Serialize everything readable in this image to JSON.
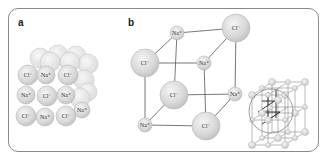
{
  "figure": {
    "panels": [
      {
        "label": "a",
        "description": "close-packed NaCl sphere model"
      },
      {
        "label": "b",
        "description": "NaCl unit cell ball-and-stick with lattice inset"
      }
    ]
  },
  "panel_a": {
    "label": "a",
    "front_ions": [
      {
        "text": "Cl⁻",
        "x": 28,
        "y": 75,
        "r": 10
      },
      {
        "text": "Na⁺",
        "x": 46,
        "y": 75,
        "r": 9
      },
      {
        "text": "Cl⁻",
        "x": 68,
        "y": 75,
        "r": 10
      },
      {
        "text": "Na⁺",
        "x": 26,
        "y": 95,
        "r": 9
      },
      {
        "text": "Cl⁻",
        "x": 47,
        "y": 96,
        "r": 10
      },
      {
        "text": "Na⁺",
        "x": 66,
        "y": 95,
        "r": 9
      },
      {
        "text": "Cl⁻",
        "x": 26,
        "y": 116,
        "r": 10
      },
      {
        "text": "Na⁺",
        "x": 45,
        "y": 117,
        "r": 9
      },
      {
        "text": "Cl⁻",
        "x": 66,
        "y": 116,
        "r": 10
      },
      {
        "text": "Na⁺",
        "x": 82,
        "y": 110,
        "r": 8
      }
    ]
  },
  "panel_b": {
    "label": "b",
    "ions": [
      {
        "id": "btl",
        "text": "Na⁺",
        "x": 177,
        "y": 33,
        "r": 7
      },
      {
        "id": "btr",
        "text": "Cl⁻",
        "x": 236,
        "y": 28,
        "r": 14
      },
      {
        "id": "bbl",
        "text": "Cl⁻",
        "x": 174,
        "y": 95,
        "r": 14
      },
      {
        "id": "bbr",
        "text": "Na⁺",
        "x": 235,
        "y": 94,
        "r": 7
      },
      {
        "id": "ftl",
        "text": "Cl⁻",
        "x": 145,
        "y": 63,
        "r": 14
      },
      {
        "id": "ftr",
        "text": "Na⁺",
        "x": 204,
        "y": 63,
        "r": 7
      },
      {
        "id": "fbl",
        "text": "Na⁺",
        "x": 145,
        "y": 125,
        "r": 7
      },
      {
        "id": "fbr",
        "text": "Cl⁻",
        "x": 206,
        "y": 126,
        "r": 14
      }
    ]
  },
  "colors": {
    "frame": "#8a8a8a",
    "sphere_fill": "#d6d6d6",
    "sphere_highlight": "#f2f2f2",
    "sphere_stroke": "#b5b5b5",
    "bond": "#555555",
    "text": "#333333"
  }
}
